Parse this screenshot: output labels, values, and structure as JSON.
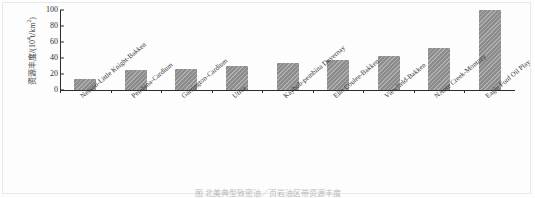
{
  "chart_data": {
    "type": "bar",
    "title": "",
    "xlabel": "",
    "ylabel": "资源丰度/(10",
    "ylabel_sup": "4",
    "ylabel_tail": "t/km",
    "ylabel_sup2": "2",
    "ylabel_end": ")",
    "ylim": [
      0,
      100
    ],
    "yticks": [
      0,
      20,
      40,
      60,
      80,
      100
    ],
    "grid": false,
    "legend": "none",
    "bar_color": "#8c8c8c",
    "categories": [
      "Nesson-Little Knight-Bakken",
      "Pembina-Cardium",
      "Garrington-Cardium",
      "Utica",
      "Kaybob-pembina Duvernay",
      "Elm Coulee-Bakken",
      "Viewfield-Bakken",
      "NAnte Creek-Montney",
      "Eagle Ford Oil Play"
    ],
    "values": [
      14,
      25,
      26,
      30,
      34,
      37,
      42,
      53,
      100
    ]
  },
  "caption": {
    "text": "图  北美典型致密油／页岩油区带资源丰度"
  }
}
